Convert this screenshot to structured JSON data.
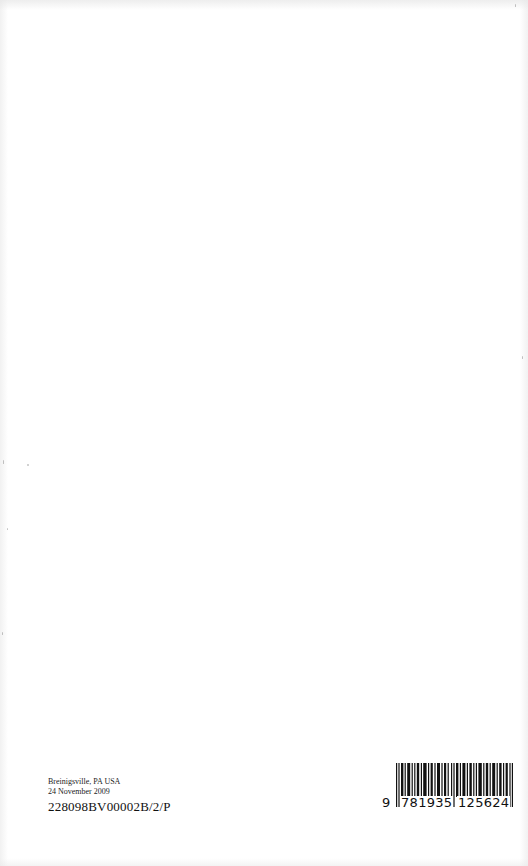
{
  "page": {
    "type": "book-back-page",
    "background": "#ffffff"
  },
  "colophon": {
    "location": "Breinigsville, PA USA",
    "date": "24 November 2009",
    "print_code": "228098BV00002B/2/P"
  },
  "barcode": {
    "icon": "isbn-barcode-icon",
    "isbn_digits": "9781935125624",
    "first_digit": "9",
    "left_group": "781935",
    "right_group": "125624",
    "bar_color": "#111111"
  }
}
